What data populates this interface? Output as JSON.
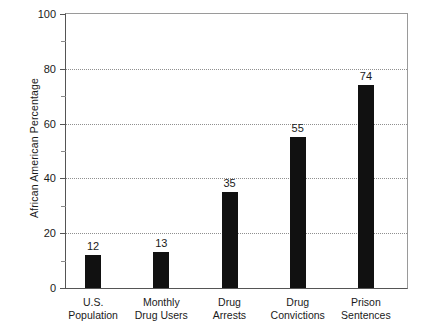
{
  "chart_data": {
    "type": "bar",
    "title": "",
    "xlabel": "",
    "ylabel": "African American Percentage",
    "ylim": [
      0,
      100
    ],
    "ytick_step_major": 20,
    "ytick_step_minor": 10,
    "grid": "horizontal-dotted at 20, 40, 60, 80",
    "legend": "none",
    "bar_color": "#111111",
    "background_color": "#ffffff",
    "categories": [
      "U.S. Population",
      "Monthly Drug Users",
      "Drug Arrests",
      "Drug Convictions",
      "Prison Sentences"
    ],
    "category_lines": [
      [
        "U.S.",
        "Population"
      ],
      [
        "Monthly",
        "Drug Users"
      ],
      [
        "Drug",
        "Arrests"
      ],
      [
        "Drug",
        "Convictions"
      ],
      [
        "Prison",
        "Sentences"
      ]
    ],
    "values": [
      12,
      13,
      35,
      55,
      74
    ],
    "value_labels": [
      "12",
      "13",
      "35",
      "55",
      "74"
    ],
    "ytick_labels": [
      "0",
      "20",
      "40",
      "60",
      "80",
      "100"
    ],
    "ytick_values": [
      0,
      20,
      40,
      60,
      80,
      100
    ],
    "yminor_values": [
      10,
      30,
      50,
      70,
      90
    ],
    "gridline_values": [
      20,
      40,
      60,
      80
    ]
  },
  "axis": {
    "y_title": "African American Percentage"
  }
}
